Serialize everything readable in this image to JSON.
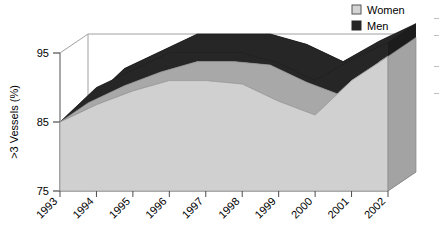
{
  "chart_data": {
    "type": "area",
    "style": "3d-stacked-area",
    "title": "",
    "xlabel": "",
    "ylabel": ">3 Vessels (%)",
    "categories": [
      "1993",
      "1994",
      "1995",
      "1996",
      "1997",
      "1998",
      "1999",
      "2000",
      "2001",
      "2002"
    ],
    "x": [
      1993,
      1994,
      1995,
      1996,
      1997,
      1998,
      1999,
      2000,
      2001,
      2002
    ],
    "ylim": [
      75,
      97
    ],
    "yticks": [
      75,
      85,
      95
    ],
    "ytick_labels": [
      "75",
      "85",
      "95"
    ],
    "grid": false,
    "legend_position": "top-right",
    "series": [
      {
        "name": "Women",
        "color": "#d0d0d0",
        "side_color": "#a8a8a8",
        "values": [
          85.0,
          87.5,
          89.5,
          91.0,
          91.0,
          90.5,
          88.0,
          86.0,
          91.0,
          94.5
        ]
      },
      {
        "name": "Men",
        "color": "#262626",
        "side_color": "#4a4a4a",
        "values": [
          85.0,
          90.0,
          92.5,
          95.0,
          95.0,
          95.0,
          93.5,
          91.0,
          94.0,
          96.5
        ]
      }
    ],
    "annotations": []
  },
  "legend": {
    "items": [
      {
        "label": "Women",
        "swatch": "#d4d4d4"
      },
      {
        "label": "Men",
        "swatch": "#262626"
      }
    ]
  },
  "axes": {
    "y": {
      "title": ">3 Vessels (%)",
      "ticks": [
        "95",
        "85",
        "75"
      ]
    },
    "x": {
      "ticks": [
        "1993",
        "1994",
        "1995",
        "1996",
        "1997",
        "1998",
        "1999",
        "2000",
        "2001",
        "2002"
      ]
    }
  }
}
